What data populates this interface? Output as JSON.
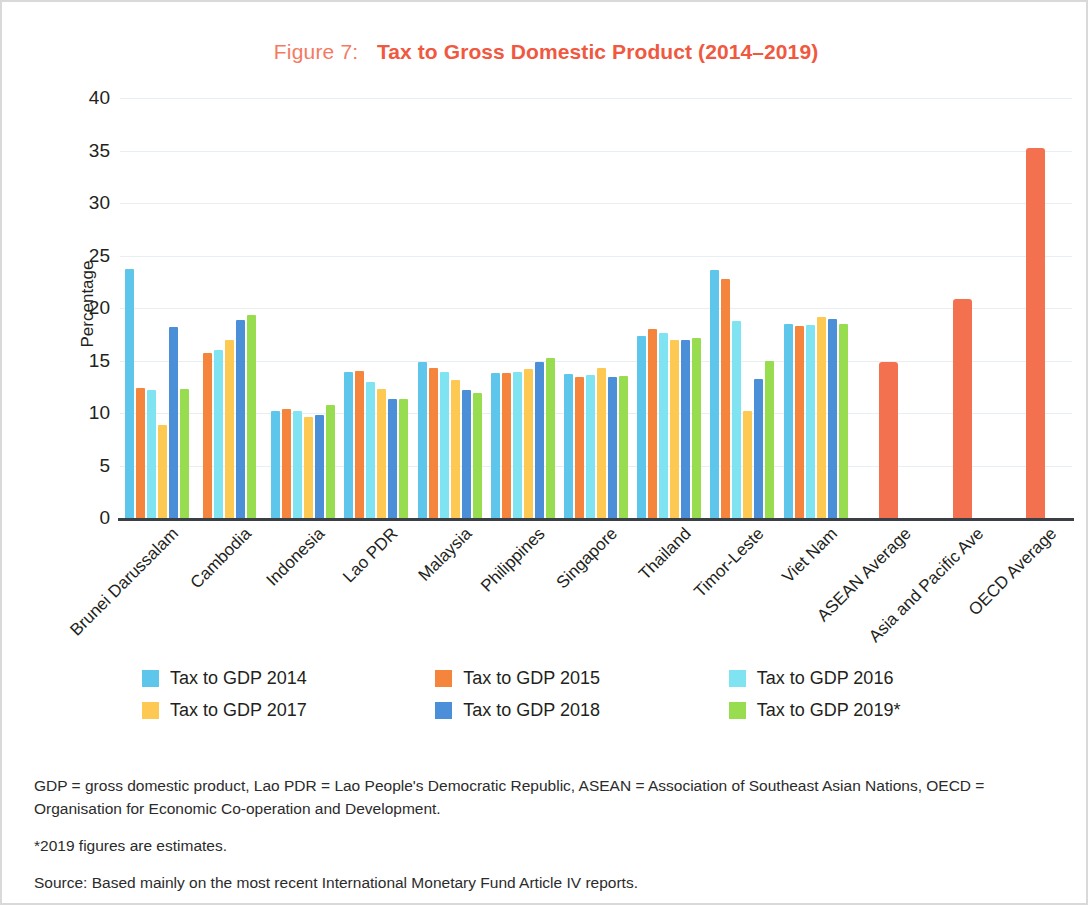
{
  "figure": {
    "number_label": "Figure 7:",
    "title": "Tax to Gross Domestic Product (2014–2019)"
  },
  "notes": {
    "abbreviations": "GDP = gross domestic product, Lao PDR = Lao People's Democratic Republic, ASEAN = Association of Southeast Asian Nations, OECD = Organisation for Economic Co-operation and Development.",
    "estimates": "*2019 figures are estimates.",
    "source": "Source: Based mainly on the most recent International Monetary Fund Article IV reports."
  },
  "colors": {
    "s2014": "#5ec6ea",
    "s2015": "#f5853c",
    "s2016": "#7fe3f2",
    "s2017": "#fdc953",
    "s2018": "#4a8fd8",
    "s2019": "#98dc4f",
    "average_bar": "#f4714f",
    "title_accent": "#f0583f",
    "axis": "#3a3f45",
    "grid": "#e8eef2"
  },
  "chart_data": {
    "type": "bar",
    "title": "Tax to Gross Domestic Product (2014–2019)",
    "xlabel": "",
    "ylabel": "Percentage",
    "ylim": [
      0,
      40
    ],
    "yticks": [
      40,
      35,
      30,
      25,
      20,
      15,
      10,
      5,
      0
    ],
    "grid": true,
    "legend_position": "bottom",
    "categories": [
      "Brunei Darussalam",
      "Cambodia",
      "Indonesia",
      "Lao PDR",
      "Malaysia",
      "Philippines",
      "Singapore",
      "Thailand",
      "Timor-Leste",
      "Viet Nam",
      "ASEAN Average",
      "Asia and Pacific Ave",
      "OECD Average"
    ],
    "series": [
      {
        "name": "Tax to GDP 2014",
        "color": "#5ec6ea",
        "values": [
          23.7,
          null,
          10.2,
          13.9,
          14.9,
          13.8,
          13.7,
          17.3,
          23.6,
          18.5,
          null,
          null,
          null
        ]
      },
      {
        "name": "Tax to GDP 2015",
        "color": "#f5853c",
        "values": [
          12.4,
          15.7,
          10.4,
          14.0,
          14.3,
          13.8,
          13.4,
          18.0,
          22.8,
          18.3,
          null,
          null,
          null
        ]
      },
      {
        "name": "Tax to GDP 2016",
        "color": "#7fe3f2",
        "values": [
          12.2,
          16.0,
          10.2,
          13.0,
          13.9,
          13.9,
          13.6,
          17.6,
          18.8,
          18.4,
          null,
          null,
          null
        ]
      },
      {
        "name": "Tax to GDP 2017",
        "color": "#fdc953",
        "values": [
          8.9,
          17.0,
          9.6,
          12.3,
          13.1,
          14.2,
          14.3,
          17.0,
          10.2,
          19.1,
          null,
          null,
          null
        ]
      },
      {
        "name": "Tax to GDP 2018",
        "color": "#4a8fd8",
        "values": [
          18.2,
          18.9,
          9.8,
          11.3,
          12.2,
          14.9,
          13.4,
          17.0,
          13.2,
          19.0,
          null,
          null,
          null
        ]
      },
      {
        "name": "Tax to GDP 2019*",
        "color": "#98dc4f",
        "values": [
          12.3,
          19.3,
          10.8,
          11.3,
          11.9,
          15.2,
          13.5,
          17.1,
          15.0,
          18.5,
          null,
          null,
          null
        ]
      },
      {
        "name": "Average",
        "color": "#f4714f",
        "values": [
          null,
          null,
          null,
          null,
          null,
          null,
          null,
          null,
          null,
          null,
          14.9,
          20.9,
          35.2
        ]
      }
    ]
  }
}
